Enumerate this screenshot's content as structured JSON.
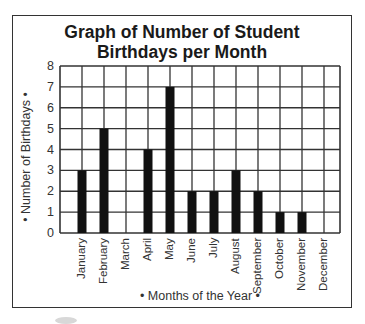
{
  "chart_data": {
    "type": "bar",
    "title": "Graph of Number of Student Birthdays per Month",
    "title_lines": [
      "Graph of Number of Student",
      "Birthdays per Month"
    ],
    "xlabel": "• Months of the Year •",
    "ylabel": "• Number of Birthdays •",
    "categories": [
      "January",
      "February",
      "March",
      "April",
      "May",
      "June",
      "July",
      "August",
      "September",
      "October",
      "November",
      "December"
    ],
    "values": [
      3,
      5,
      0,
      4,
      7,
      2,
      2,
      3,
      2,
      1,
      1,
      0
    ],
    "ylim": [
      0,
      8
    ],
    "yticks": [
      "0",
      "1",
      "2",
      "3",
      "4",
      "5",
      "6",
      "7",
      "8"
    ],
    "grid": true,
    "legend": null,
    "bar_color": "#111111",
    "grid_color": "#333333"
  }
}
